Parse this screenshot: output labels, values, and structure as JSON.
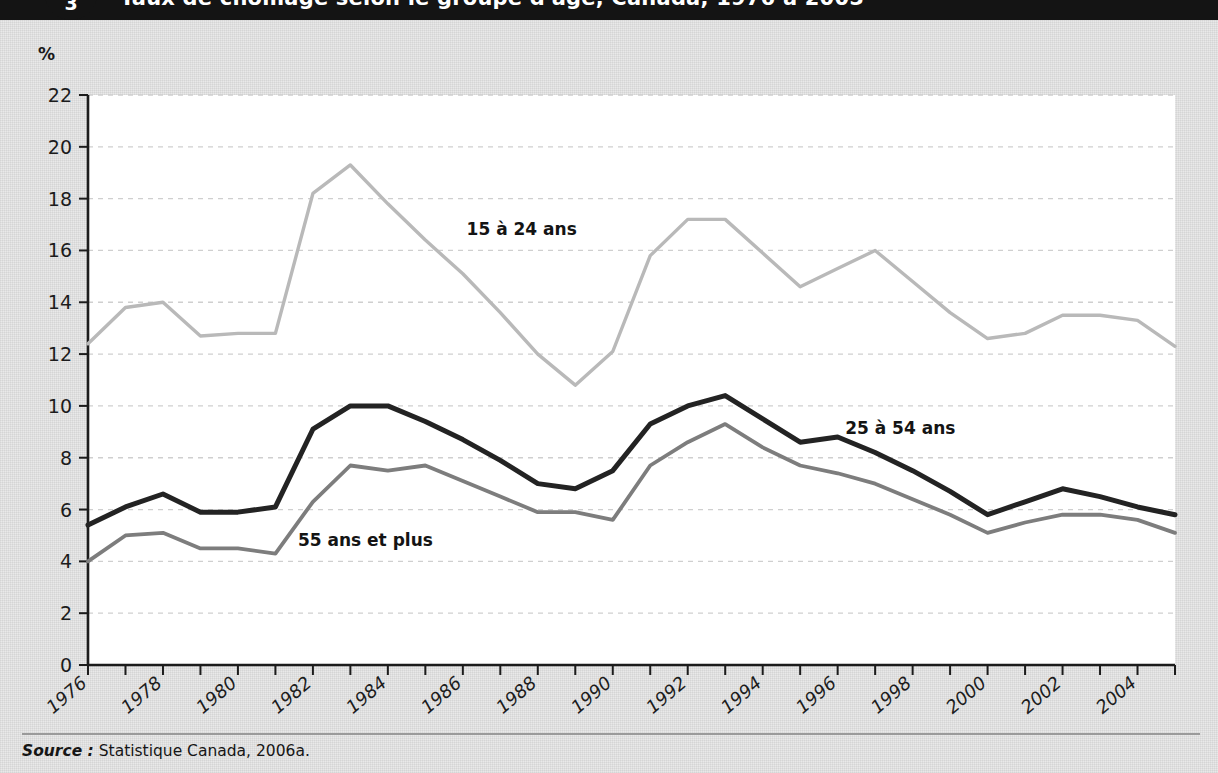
{
  "banner": {
    "number": "3",
    "title": "Taux de chômage selon le groupe d'âge, Canada, 1976 à 2005"
  },
  "axis_unit_label": "%",
  "source": {
    "keyword": "Source :",
    "text": "Statistique Canada, 2006a."
  },
  "colors": {
    "series_15_24": "#b9b9b9",
    "series_25_54": "#232323",
    "series_55_plus": "#7d7d7d",
    "axis": "#1c1c1c",
    "gridline": "#cfcfcf",
    "plot_background": "#ffffff",
    "page_background": "#e9e9e9",
    "banner_background": "#141414"
  },
  "chart_data": {
    "type": "line",
    "title": "Taux de chômage selon le groupe d'âge, Canada, 1976 à 2005",
    "xlabel": "",
    "ylabel": "%",
    "ylim": [
      0,
      22
    ],
    "ytick_step": 2,
    "yticks": [
      "0",
      "2",
      "4",
      "6",
      "8",
      "10",
      "12",
      "14",
      "16",
      "18",
      "20",
      "22"
    ],
    "xlim": [
      1976,
      2005
    ],
    "xticks_labeled": [
      "1976",
      "1978",
      "1980",
      "1982",
      "1984",
      "1986",
      "1988",
      "1990",
      "1992",
      "1994",
      "1996",
      "1998",
      "2000",
      "2002",
      "2004"
    ],
    "xtick_step": 1,
    "grid": "horizontal-dashed",
    "legend": "inline-annotations",
    "x": [
      1976,
      1977,
      1978,
      1979,
      1980,
      1981,
      1982,
      1983,
      1984,
      1985,
      1986,
      1987,
      1988,
      1989,
      1990,
      1991,
      1992,
      1993,
      1994,
      1995,
      1996,
      1997,
      1998,
      1999,
      2000,
      2001,
      2002,
      2003,
      2004,
      2005
    ],
    "series": [
      {
        "name": "15 à 24 ans",
        "color": "#b9b9b9",
        "label_x": 1986.1,
        "label_y": 16.6,
        "values": [
          12.4,
          13.8,
          14.0,
          12.7,
          12.8,
          12.8,
          18.2,
          19.3,
          17.8,
          16.4,
          15.1,
          13.6,
          12.0,
          10.8,
          12.1,
          15.8,
          17.2,
          17.2,
          15.9,
          14.6,
          15.3,
          16.0,
          14.8,
          13.6,
          12.6,
          12.8,
          13.5,
          13.5,
          13.3,
          12.3
        ]
      },
      {
        "name": "25 à 54 ans",
        "color": "#232323",
        "label_x": 1996.2,
        "label_y": 8.9,
        "values": [
          5.4,
          6.1,
          6.6,
          5.9,
          5.9,
          6.1,
          9.1,
          10.0,
          10.0,
          9.4,
          8.7,
          7.9,
          7.0,
          6.8,
          7.5,
          9.3,
          10.0,
          10.4,
          9.5,
          8.6,
          8.8,
          8.2,
          7.5,
          6.7,
          5.8,
          6.3,
          6.8,
          6.5,
          6.1,
          5.8
        ]
      },
      {
        "name": "55 ans et plus",
        "color": "#7d7d7d",
        "label_x": 1981.6,
        "label_y": 4.6,
        "values": [
          4.0,
          5.0,
          5.1,
          4.5,
          4.5,
          4.3,
          6.3,
          7.7,
          7.5,
          7.7,
          7.1,
          6.5,
          5.9,
          5.9,
          5.6,
          7.7,
          8.6,
          9.3,
          8.4,
          7.7,
          7.4,
          7.0,
          6.4,
          5.8,
          5.1,
          5.5,
          5.8,
          5.8,
          5.6,
          5.1
        ]
      }
    ]
  }
}
